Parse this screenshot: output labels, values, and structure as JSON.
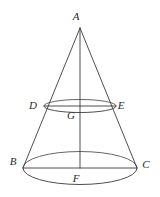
{
  "figure": {
    "kind": "geometry-diagram",
    "background_color": "#ffffff",
    "stroke_color": "#3a3a3a",
    "label_color": "#2b2b2b",
    "canvas": {
      "width": 160,
      "height": 197
    },
    "labels": [
      {
        "id": "A",
        "text": "A",
        "x": 76,
        "y": 16,
        "role": "apex"
      },
      {
        "id": "D",
        "text": "D",
        "x": 33,
        "y": 105,
        "role": "upper-circle-left"
      },
      {
        "id": "E",
        "text": "E",
        "x": 121,
        "y": 105,
        "role": "upper-circle-right"
      },
      {
        "id": "G",
        "text": "G",
        "x": 71,
        "y": 115,
        "role": "upper-circle-center"
      },
      {
        "id": "B",
        "text": "B",
        "x": 13,
        "y": 161,
        "role": "base-circle-left"
      },
      {
        "id": "C",
        "text": "C",
        "x": 146,
        "y": 164,
        "role": "base-circle-right"
      },
      {
        "id": "F",
        "text": "F",
        "x": 76,
        "y": 178,
        "role": "base-circle-center"
      }
    ],
    "points": {
      "A": {
        "x": 80,
        "y": 28
      },
      "D": {
        "x": 44,
        "y": 106
      },
      "E": {
        "x": 116,
        "y": 106
      },
      "G": {
        "x": 80,
        "y": 106
      },
      "B": {
        "x": 23,
        "y": 168
      },
      "C": {
        "x": 137,
        "y": 168
      },
      "F": {
        "x": 80,
        "y": 168
      }
    },
    "ellipses": [
      {
        "id": "upper-circle",
        "cx": 80,
        "cy": 106,
        "rx": 36,
        "ry": 6.5,
        "chord_label_left": "D",
        "chord_label_right": "E",
        "center_label": "G"
      },
      {
        "id": "base-circle",
        "cx": 80,
        "cy": 168,
        "rx": 57,
        "ry": 16.5,
        "chord_label_left": "B",
        "chord_label_right": "C",
        "center_label": "F"
      }
    ],
    "segments": [
      {
        "id": "slant-AB",
        "from": "A",
        "to": "B"
      },
      {
        "id": "slant-AC",
        "from": "A",
        "to": "C"
      },
      {
        "id": "axis-AF",
        "from": "A",
        "to": "F"
      },
      {
        "id": "diameter-DE",
        "from": "D",
        "to": "E"
      },
      {
        "id": "diameter-BC",
        "from": "B",
        "to": "C"
      }
    ]
  }
}
